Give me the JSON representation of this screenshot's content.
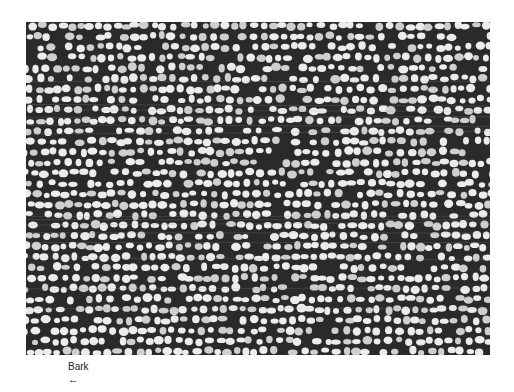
{
  "figure": {
    "label": "Bark",
    "arrow": "←",
    "colors": {
      "background": "#ffffff",
      "tissue_dark": "#2a2a2a",
      "cell_light": "#ececec",
      "cell_mid": "#cfcfcf"
    },
    "cells": {
      "row_spacing": 10.5,
      "col_spacing": 9.5,
      "rx": 4.2,
      "ry": 3.6,
      "jitter": 2.2,
      "seed": 7
    }
  }
}
